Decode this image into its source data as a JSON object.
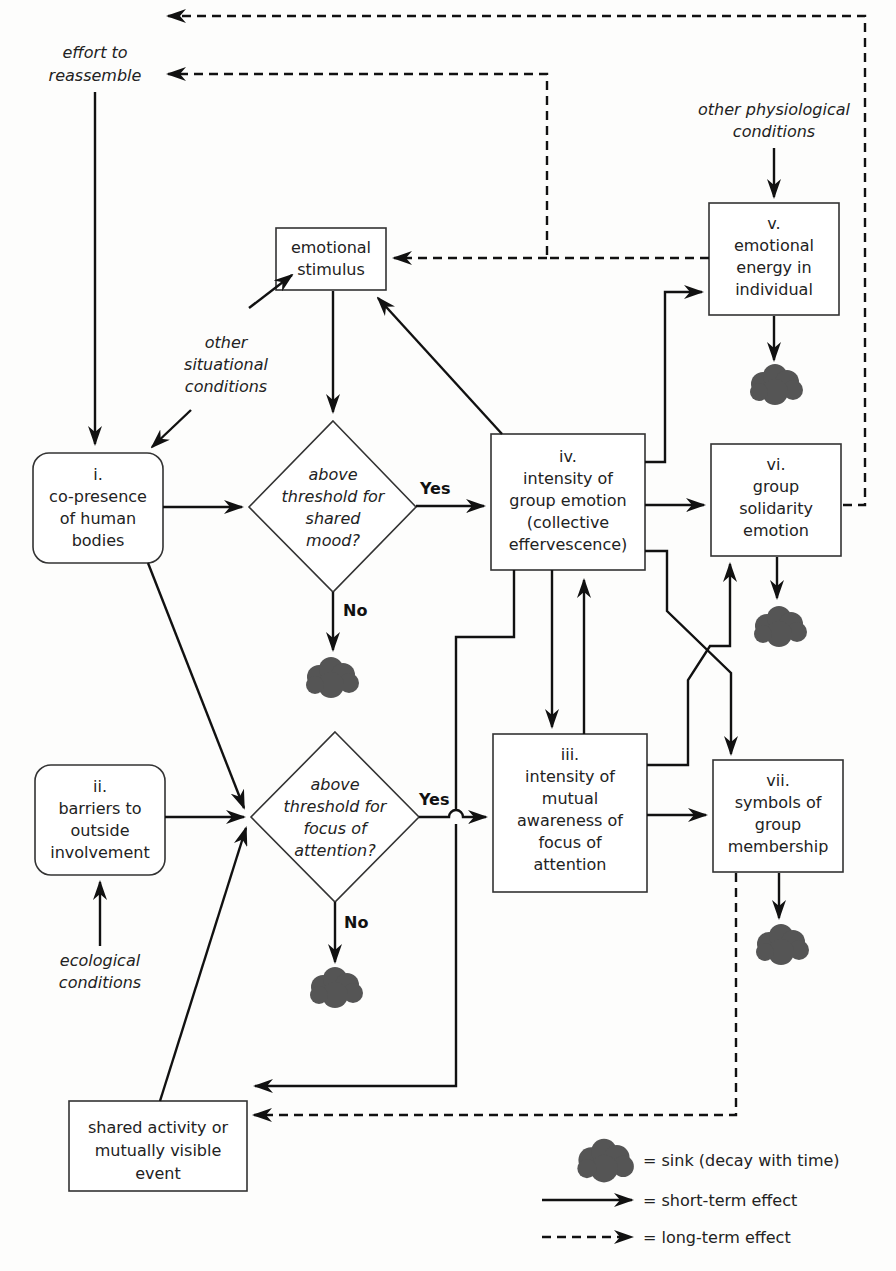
{
  "nodes": {
    "i": {
      "numeral": "i.",
      "lines": [
        "co-presence",
        "of human",
        "bodies"
      ]
    },
    "ii": {
      "numeral": "ii.",
      "lines": [
        "barriers to",
        "outside",
        "involvement"
      ]
    },
    "iii": {
      "numeral": "iii.",
      "lines": [
        "intensity of",
        "mutual",
        "awareness of",
        "focus of",
        "attention"
      ]
    },
    "iv": {
      "numeral": "iv.",
      "lines": [
        "intensity of",
        "group emotion",
        "(collective",
        "effervescence)"
      ]
    },
    "v": {
      "numeral": "v.",
      "lines": [
        "emotional",
        "energy in",
        "individual"
      ]
    },
    "vi": {
      "numeral": "vi.",
      "lines": [
        "group",
        "solidarity",
        "emotion"
      ]
    },
    "vii": {
      "numeral": "vii.",
      "lines": [
        "symbols of",
        "group",
        "membership"
      ]
    },
    "stimulus": {
      "lines": [
        "emotional",
        "stimulus"
      ]
    },
    "shared_activity": {
      "lines": [
        "shared activity or",
        "mutually visible",
        "event"
      ]
    }
  },
  "decisions": {
    "mood": {
      "lines": [
        "above",
        "threshold for",
        "shared",
        "mood?"
      ],
      "yes": "Yes",
      "no": "No"
    },
    "focus": {
      "lines": [
        "above",
        "threshold for",
        "focus of",
        "attention?"
      ],
      "yes": "Yes",
      "no": "No"
    }
  },
  "conditions": {
    "effort": [
      "effort to",
      "reassemble"
    ],
    "physiological": [
      "other physiological",
      "conditions"
    ],
    "situational": [
      "other",
      "situational",
      "conditions"
    ],
    "ecological": [
      "ecological",
      "conditions"
    ]
  },
  "legend": {
    "sink": "= sink (decay with time)",
    "short": "= short-term effect",
    "long": "= long-term effect"
  },
  "colors": {
    "line": "#111111",
    "sink": "#555555",
    "box_border": "#333333",
    "background": "#fdfdfc"
  }
}
